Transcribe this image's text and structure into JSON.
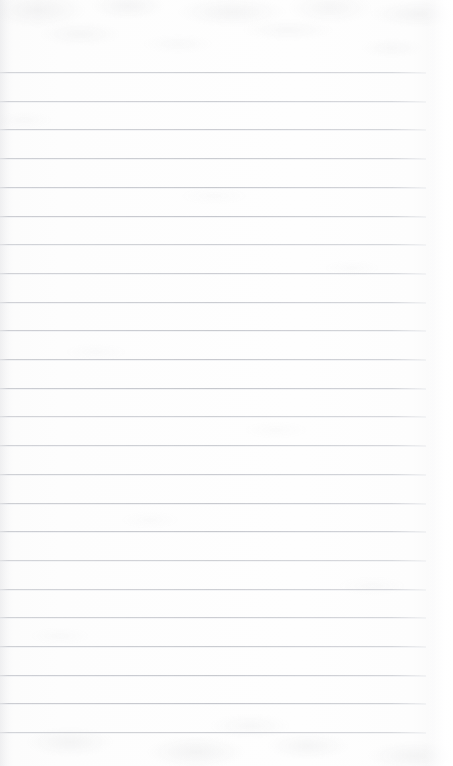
{
  "document": {
    "kind": "lined-paper-scan",
    "title": "Blank ruled notepad page",
    "text_content": "",
    "page_number": "",
    "canvas": {
      "width_px": 453,
      "height_px": 766
    },
    "colors": {
      "paper": "#fdfdfd",
      "paper_highlight": "#ffffff",
      "paper_shadow": "#f7f7f8",
      "rule_line": "#c6c8ce",
      "rule_line_soft": "#dee0e5",
      "grain": "#969aa0"
    },
    "ruling": {
      "style": "wide-ruled horizontal lines",
      "line_count": 24,
      "first_line_y_px": 72,
      "line_spacing_px": 28.7,
      "last_line_y_px": 732,
      "line_thickness_px": 1,
      "line_start_x_px": 0,
      "line_end_x_px": 426,
      "margin_rule": "none",
      "holes": "none"
    },
    "zones": {
      "header_label": "",
      "footer_label": "",
      "body_label": ""
    }
  }
}
